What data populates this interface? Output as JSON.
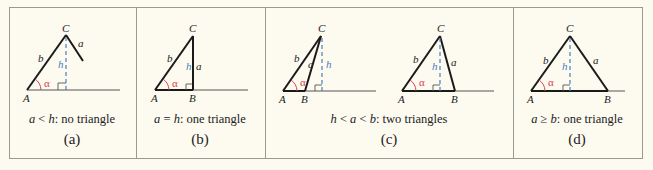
{
  "figure": {
    "colors": {
      "background": "#fdfaf0",
      "border": "#9a9a92",
      "line": "#1a1a1a",
      "baseline": "#555555",
      "height_line": "#4a7fc0",
      "angle": "#d8405a"
    },
    "panels": [
      {
        "id": "a",
        "label": "(a)",
        "caption_var1": "a",
        "caption_rel": " < ",
        "caption_var2": "h",
        "caption_rest": ": no triangle",
        "vertices": {
          "A": "A",
          "C": "C"
        },
        "sides": {
          "a": "a",
          "b": "b",
          "h": "h"
        },
        "angle": "α"
      },
      {
        "id": "b",
        "label": "(b)",
        "caption_var1": "a",
        "caption_rel": " = ",
        "caption_var2": "h",
        "caption_rest": ": one triangle",
        "vertices": {
          "A": "A",
          "B": "B",
          "C": "C"
        },
        "sides": {
          "a": "a",
          "b": "b",
          "h": "h"
        },
        "angle": "α"
      },
      {
        "id": "c",
        "label": "(c)",
        "caption_var0": "h",
        "caption_rel0": " < ",
        "caption_var1": "a",
        "caption_rel": " < ",
        "caption_var2": "b",
        "caption_rest": ": two triangles",
        "vertices": {
          "A": "A",
          "B": "B",
          "C": "C"
        },
        "sides": {
          "a": "a",
          "b": "b",
          "h": "h"
        },
        "angle": "α"
      },
      {
        "id": "d",
        "label": "(d)",
        "caption_var1": "a",
        "caption_rel": " ≥ ",
        "caption_var2": "b",
        "caption_rest": ": one triangle",
        "vertices": {
          "A": "A",
          "B": "B",
          "C": "C"
        },
        "sides": {
          "a": "a",
          "b": "b",
          "h": "h"
        },
        "angle": "α"
      }
    ]
  }
}
